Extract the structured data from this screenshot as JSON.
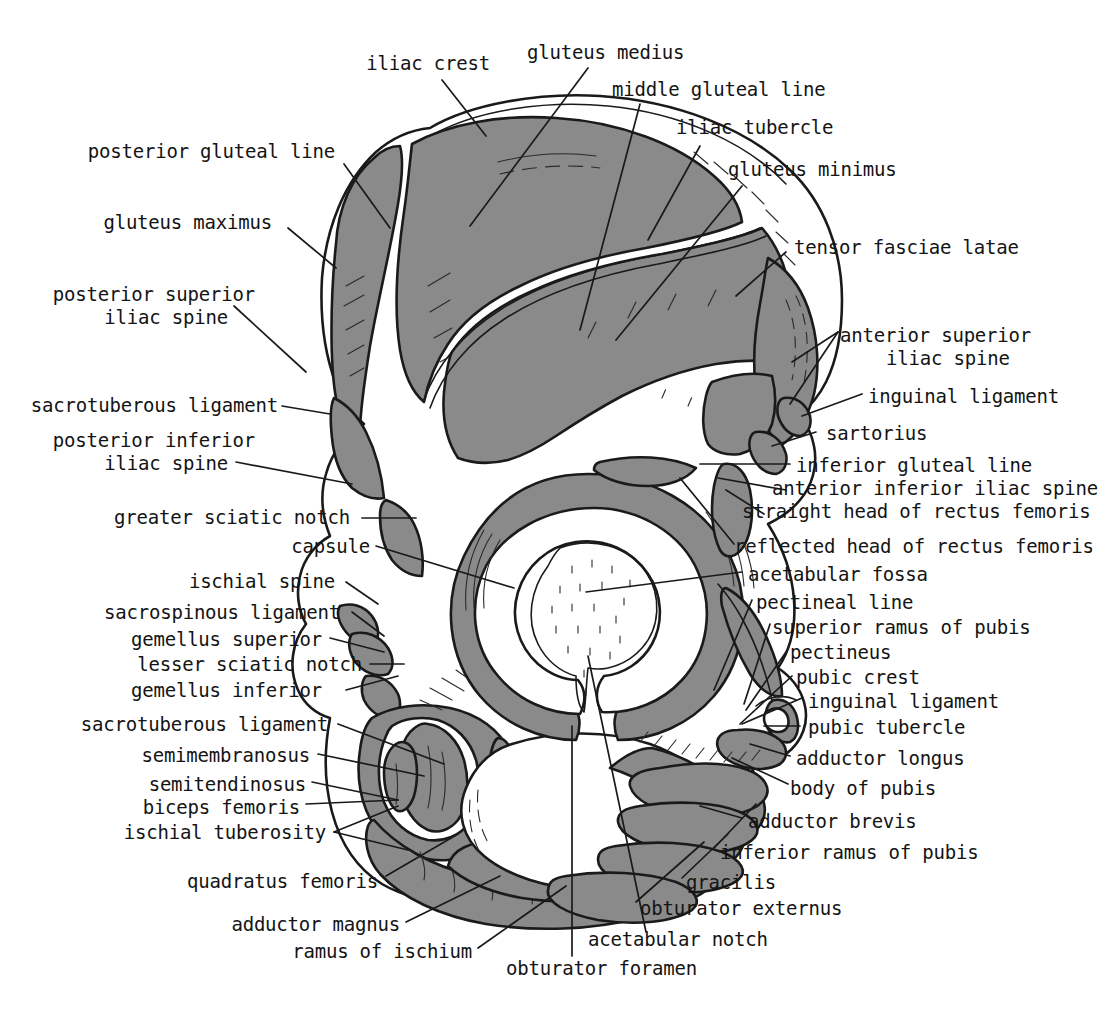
{
  "figure": {
    "type": "anatomical-illustration",
    "background_color": "#ffffff",
    "attachment_fill_color": "#8a8a8a",
    "bone_fill_color": "#ffffff",
    "outline_color": "#1a1a1a",
    "leader_line_color": "#1a1a1a"
  },
  "labels": {
    "iliac_crest": "iliac crest",
    "gluteus_medius": "gluteus medius",
    "middle_gluteal_line": "middle gluteal line",
    "iliac_tubercle": "iliac tubercle",
    "gluteus_minimus": "gluteus minimus",
    "tensor_fasciae_latae": "tensor fasciae latae",
    "posterior_gluteal_line": "posterior gluteal line",
    "gluteus_maximus": "gluteus maximus",
    "posterior_superior_iliac_spine_1": "posterior superior",
    "posterior_superior_iliac_spine_2": "iliac spine",
    "anterior_superior_iliac_spine_1": "anterior superior",
    "anterior_superior_iliac_spine_2": "iliac spine",
    "inguinal_ligament_top": "inguinal ligament",
    "sacrotuberous_ligament_top": "sacrotuberous ligament",
    "sartorius": "sartorius",
    "posterior_inferior_iliac_spine_1": "posterior inferior",
    "posterior_inferior_iliac_spine_2": "iliac spine",
    "inferior_gluteal_line": "inferior gluteal line",
    "anterior_inferior_iliac_spine": "anterior inferior iliac spine",
    "straight_head_of_rectus_femoris": "straight head of rectus femoris",
    "greater_sciatic_notch": "greater sciatic notch",
    "capsule": "capsule",
    "reflected_head_of_rectus_femoris": "reflected head of rectus femoris",
    "acetabular_fossa": "acetabular fossa",
    "ischial_spine": "ischial spine",
    "pectineal_line": "pectineal line",
    "sacrospinous_ligament": "sacrospinous ligament",
    "superior_ramus_of_pubis": "superior ramus of pubis",
    "gemellus_superior": "gemellus superior",
    "pectineus": "pectineus",
    "lesser_sciatic_notch": "lesser sciatic notch",
    "pubic_crest": "pubic crest",
    "gemellus_inferior": "gemellus inferior",
    "inguinal_ligament_bottom": "inguinal ligament",
    "sacrotuberous_ligament_bottom": "sacrotuberous ligament",
    "pubic_tubercle": "pubic tubercle",
    "semimembranosus": "semimembranosus",
    "adductor_longus": "adductor longus",
    "semitendinosus": "semitendinosus",
    "biceps_femoris": "biceps femoris",
    "body_of_pubis": "body of pubis",
    "ischial_tuberosity": "ischial tuberosity",
    "adductor_brevis": "adductor brevis",
    "inferior_ramus_of_pubis": "inferior ramus of pubis",
    "quadratus_femoris": "quadratus femoris",
    "gracilis": "gracilis",
    "obturator_externus": "obturator externus",
    "adductor_magnus": "adductor magnus",
    "ramus_of_ischium": "ramus of ischium",
    "acetabular_notch": "acetabular notch",
    "obturator_foramen": "obturator foramen"
  }
}
